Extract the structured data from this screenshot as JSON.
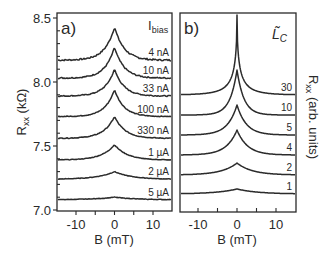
{
  "chart_data": [
    {
      "type": "line",
      "panel_label": "a)",
      "title": "",
      "xlabel": "B (mT)",
      "ylabel": "Rxx (kΩ)",
      "ylabel_main": "R",
      "ylabel_sub": "xx",
      "ylabel_unit": " (kΩ)",
      "xlim": [
        -15,
        15
      ],
      "ylim": [
        7.0,
        8.55
      ],
      "xticks": [
        -10,
        0,
        10
      ],
      "xtick_labels": [
        "-10",
        "0",
        "10"
      ],
      "yticks": [
        7.0,
        7.5,
        8.0,
        8.5
      ],
      "ytick_labels": [
        "7.0",
        "7.5",
        "8.0",
        "8.5"
      ],
      "grid": false,
      "legend_title": "I",
      "legend_title_sub": "bias",
      "series": [
        {
          "name": "4 nA",
          "baseline": 8.17,
          "peak": 8.43,
          "width": 4.5,
          "noise": 0.006
        },
        {
          "name": "10 nA",
          "baseline": 8.03,
          "peak": 8.27,
          "width": 4.5,
          "noise": 0.005
        },
        {
          "name": "33 nA",
          "baseline": 7.89,
          "peak": 8.1,
          "width": 4.5,
          "noise": 0.004
        },
        {
          "name": "100 nA",
          "baseline": 7.73,
          "peak": 7.94,
          "width": 4.5,
          "noise": 0.003
        },
        {
          "name": "330 nA",
          "baseline": 7.56,
          "peak": 7.73,
          "width": 5.0,
          "noise": 0.003
        },
        {
          "name": "1 µA",
          "baseline": 7.39,
          "peak": 7.51,
          "width": 6.0,
          "noise": 0.002
        },
        {
          "name": "2 µA",
          "baseline": 7.24,
          "peak": 7.3,
          "width": 8.0,
          "noise": 0.002
        },
        {
          "name": "5 µA",
          "baseline": 7.08,
          "peak": 7.1,
          "width": 10.0,
          "noise": 0.002
        }
      ]
    },
    {
      "type": "line",
      "panel_label": "b)",
      "title": "",
      "xlabel": "B (mT)",
      "ylabel": "Rxx (arb. units)",
      "ylabel_main": "R",
      "ylabel_sub": "xx",
      "ylabel_unit": " (arb. units)",
      "xlim": [
        -15,
        15
      ],
      "ylim": [
        0,
        200
      ],
      "xticks": [
        -10,
        0,
        10
      ],
      "xtick_labels": [
        "-10",
        "0",
        "10"
      ],
      "yticks": [],
      "grid": false,
      "legend_title": "L̃",
      "legend_title_sub": "C",
      "series": [
        {
          "name": "30",
          "baseline_px": 95,
          "peak_px": 15,
          "width": 2.2
        },
        {
          "name": "10",
          "baseline_px": 115,
          "peak_px": 70,
          "width": 3.0
        },
        {
          "name": "5",
          "baseline_px": 135,
          "peak_px": 105,
          "width": 4.0
        },
        {
          "name": "4",
          "baseline_px": 155,
          "peak_px": 130,
          "width": 4.5
        },
        {
          "name": "2",
          "baseline_px": 175,
          "peak_px": 163,
          "width": 6.5
        },
        {
          "name": "1",
          "baseline_px": 194,
          "peak_px": 189,
          "width": 9.0
        }
      ]
    }
  ]
}
